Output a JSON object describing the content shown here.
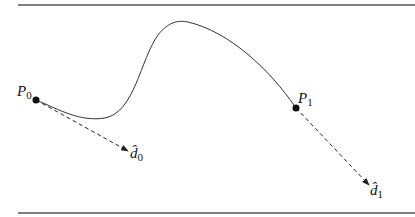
{
  "diagram": {
    "points": [
      {
        "name": "P",
        "sub": "0",
        "x": 36,
        "y": 100
      },
      {
        "name": "P",
        "sub": "1",
        "x": 296,
        "y": 108
      }
    ],
    "directions": [
      {
        "name": "d̂",
        "sub": "0"
      },
      {
        "name": "d̂",
        "sub": "1"
      }
    ],
    "colors": {
      "ink": "#222222",
      "rule": "#555555"
    }
  }
}
